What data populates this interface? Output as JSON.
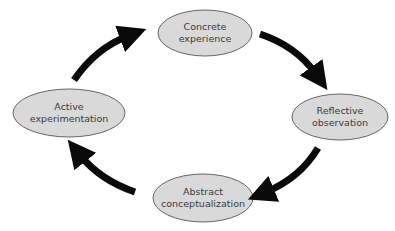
{
  "diagram": {
    "type": "cycle",
    "colors": {
      "node_fill": "#d9d9d9",
      "node_stroke": "#666666",
      "arrow": "#0a0a0a",
      "background": "#ffffff"
    },
    "nodes": [
      {
        "id": "concrete",
        "label": "Concrete\nexperience"
      },
      {
        "id": "reflective",
        "label": "Reflective\nobservation"
      },
      {
        "id": "abstract",
        "label": "Abstract\nconceptualization"
      },
      {
        "id": "active",
        "label": "Active\nexperimentation"
      }
    ],
    "edges": [
      {
        "from": "concrete",
        "to": "reflective"
      },
      {
        "from": "reflective",
        "to": "abstract"
      },
      {
        "from": "abstract",
        "to": "active"
      },
      {
        "from": "active",
        "to": "concrete"
      }
    ]
  }
}
